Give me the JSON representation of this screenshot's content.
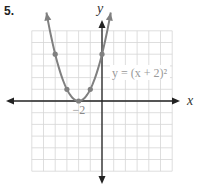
{
  "problem": {
    "number_label": "5."
  },
  "chart_data": {
    "type": "line",
    "title": "",
    "equation": "y = (x + 2)²",
    "xlabel": "x",
    "ylabel": "y",
    "xlim": [
      -6,
      6
    ],
    "ylim": [
      -6,
      6
    ],
    "grid": true,
    "tick_labels": [
      {
        "x": -2,
        "y": 0,
        "text": "−2"
      }
    ],
    "series": [
      {
        "name": "y = (x + 2)²",
        "function": "(x+2)^2",
        "color": "#808080",
        "points": [
          {
            "x": -4,
            "y": 4
          },
          {
            "x": -3,
            "y": 1
          },
          {
            "x": -2,
            "y": 0
          },
          {
            "x": -1,
            "y": 1
          },
          {
            "x": 0,
            "y": 4
          }
        ],
        "curve_x_range": [
          -4.75,
          0.75
        ]
      }
    ]
  },
  "colors": {
    "grid": "#d6d6d6",
    "axis": "#222222",
    "curve": "#808080",
    "equation": "#9a9a9a"
  }
}
